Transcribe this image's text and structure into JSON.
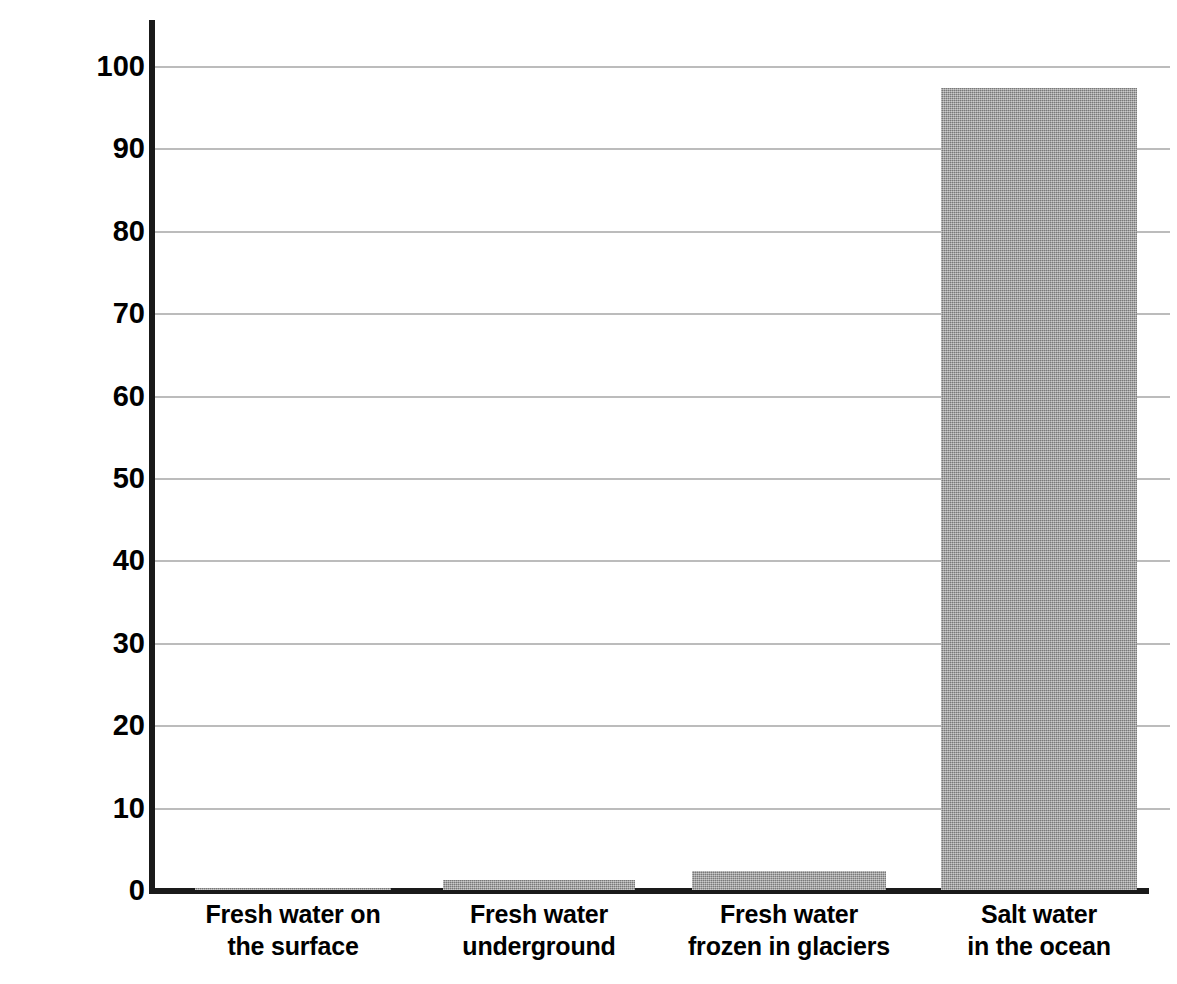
{
  "chart_data": {
    "type": "bar",
    "title": "",
    "subtitle": "",
    "xlabel": "",
    "ylabel": "Number of Liters out of 100",
    "ylim": [
      0,
      100
    ],
    "yticks": [
      0,
      10,
      20,
      30,
      40,
      50,
      60,
      70,
      80,
      90,
      100
    ],
    "ytick_labels": [
      "0",
      "10",
      "20",
      "30",
      "40",
      "50",
      "60",
      "70",
      "80",
      "90",
      "100"
    ],
    "grid": true,
    "grid_axis": "y",
    "legend": false,
    "legend_position": "none",
    "bar_color": "#9a9a9a",
    "axis_color": "#1a1a1a",
    "gridline_color": "#bcbcbc",
    "categories": [
      "Fresh water on the surface",
      "Fresh water underground",
      "Fresh water frozen in glaciers",
      "Salt water in the ocean"
    ],
    "category_label_lines": [
      [
        "Fresh water on",
        "the surface"
      ],
      [
        "Fresh water",
        "underground"
      ],
      [
        "Fresh water",
        "frozen in glaciers"
      ],
      [
        "Salt water",
        "in the ocean"
      ]
    ],
    "values": [
      0.3,
      1.2,
      2.3,
      97.3
    ]
  }
}
